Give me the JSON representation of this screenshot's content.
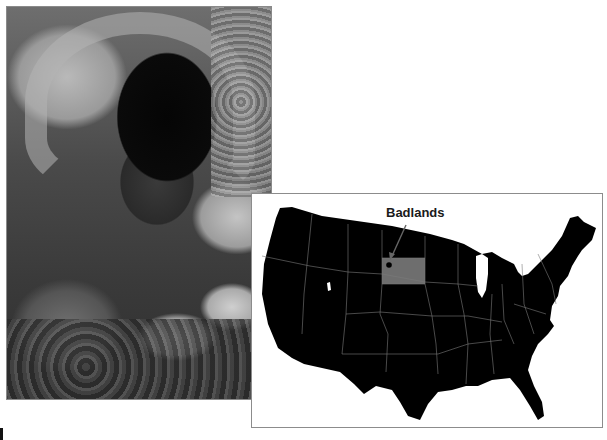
{
  "photo": {
    "subject": "person examining fossils on rocky ground",
    "style": "black-and-white"
  },
  "map": {
    "title_label": "Badlands",
    "region": "Contiguous United States",
    "highlighted_state": "South Dakota",
    "colors": {
      "land": "#000000",
      "highlight": "#6e6e6e",
      "borders": "#8a8a8a",
      "marker": "#000000",
      "background": "#ffffff"
    }
  }
}
